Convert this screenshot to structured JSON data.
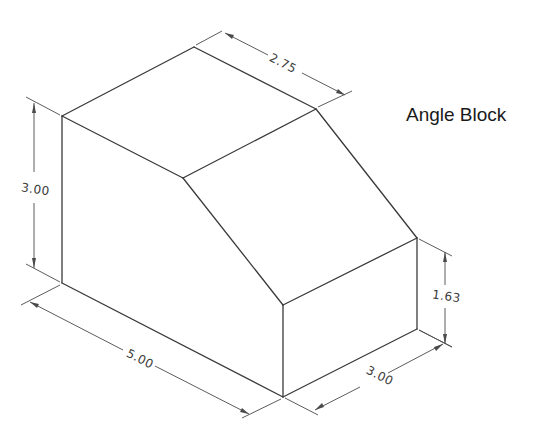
{
  "title": "Angle Block",
  "dimensions": {
    "top_depth": "2.75",
    "overall_height": "3.00",
    "lower_height": "1.63",
    "length": "5.00",
    "width": "3.00"
  },
  "colors": {
    "line": "#3a3a3a",
    "background": "#ffffff"
  }
}
